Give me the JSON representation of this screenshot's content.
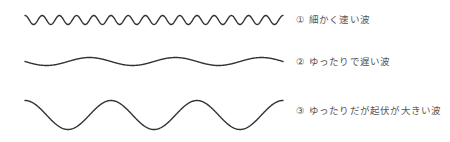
{
  "waves": [
    {
      "id": 1,
      "num": "①",
      "label": "細かく速い波",
      "x0": 25,
      "x1": 283,
      "cy": 20,
      "amp": 4.5,
      "cycles": 15,
      "phase": "crest-first"
    },
    {
      "id": 2,
      "num": "②",
      "label": "ゆったりで遅い波",
      "x0": 25,
      "x1": 283,
      "cy": 61.5,
      "amp": 4,
      "cycles": 3,
      "phase": "center-down"
    },
    {
      "id": 3,
      "num": "③",
      "label": "ゆったりだが起伏が大きい波",
      "x0": 25,
      "x1": 283,
      "cy": 115,
      "amp": 14.5,
      "cycles": 3,
      "phase": "crest-first"
    }
  ],
  "colors": {
    "stroke": "#333333",
    "text": "#555555",
    "background": "#ffffff"
  }
}
